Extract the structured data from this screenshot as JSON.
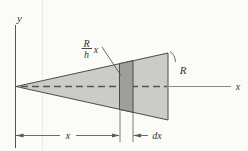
{
  "figure": {
    "labels": {
      "y_axis": "y",
      "x_axis": "x",
      "fraction_numerator": "R",
      "fraction_denominator": "h",
      "fraction_multiplier": "x",
      "radius_label": "R",
      "x_dimension": "x",
      "dx_dimension": "dx"
    },
    "colors": {
      "background": "#fbfbf8",
      "cone_fill": "#cbcbc7",
      "element_fill": "#9e9e9a",
      "outline": "#4b4b48",
      "dim_line": "#5a5a57",
      "text": "#333330"
    }
  }
}
